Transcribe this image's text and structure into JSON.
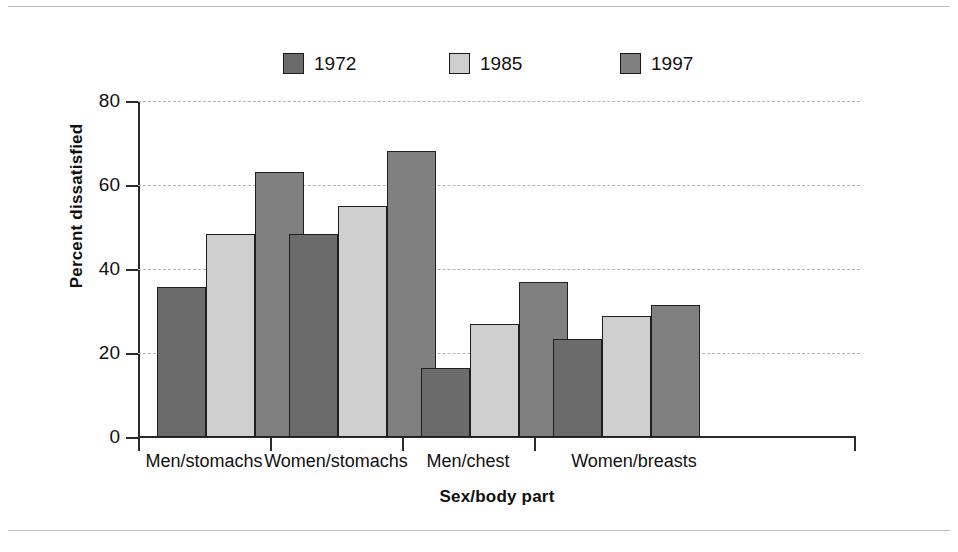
{
  "chart_data": {
    "type": "bar",
    "title": "",
    "xlabel": "Sex/body part",
    "ylabel": "Percent dissatisfied",
    "categories": [
      "Men/stomachs",
      "Women/stomachs",
      "Men/chest",
      "Women/breasts"
    ],
    "series": [
      {
        "name": "1972",
        "color": "#6b6b6b",
        "values": [
          35.7,
          48.3,
          16.4,
          23.4
        ]
      },
      {
        "name": "1985",
        "color": "#cfcfcf",
        "values": [
          48.4,
          55.0,
          26.8,
          28.8
        ]
      },
      {
        "name": "1997",
        "color": "#808080",
        "values": [
          63.2,
          68.2,
          36.8,
          31.4
        ]
      }
    ],
    "ylim": [
      0,
      80
    ],
    "yticks": [
      0,
      20,
      40,
      60,
      80
    ],
    "ytick_labels": [
      "0",
      "20",
      "40",
      "60",
      "80"
    ],
    "grid": "horizontal-dashed",
    "legend_position": "top-center"
  },
  "legend": {
    "items": [
      {
        "label": "1972",
        "color": "#6b6b6b"
      },
      {
        "label": "1985",
        "color": "#cfcfcf"
      },
      {
        "label": "1997",
        "color": "#808080"
      }
    ]
  },
  "axis": {
    "y_title": "Percent dissatisfied",
    "x_title": "Sex/body part",
    "y_ticks": [
      "80",
      "60",
      "40",
      "20",
      "0"
    ]
  },
  "categories": [
    "Men/stomachs",
    "Women/stomachs",
    "Men/chest",
    "Women/breasts"
  ],
  "colors": {
    "series_1972": "#6b6b6b",
    "series_1985": "#cfcfcf",
    "series_1997": "#808080",
    "axis": "#2b2b2b",
    "grid": "#b5b5b5",
    "rule": "#bfbfbf",
    "text": "#111111",
    "background": "#ffffff"
  }
}
